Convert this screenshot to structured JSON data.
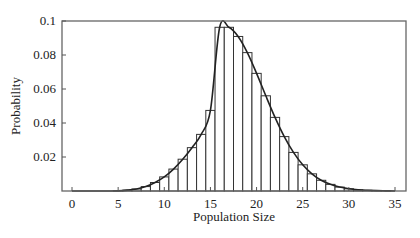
{
  "chart_data": {
    "type": "bar",
    "subtype": "histogram-with-curve",
    "title": "",
    "xlabel": "Population Size",
    "ylabel": "Probability",
    "xlim": [
      -1.2,
      36.2
    ],
    "ylim": [
      0,
      0.1
    ],
    "x_ticks": [
      0,
      5,
      10,
      15,
      20,
      25,
      30,
      35
    ],
    "y_ticks": [
      0.02,
      0.04,
      0.06,
      0.08,
      0.1
    ],
    "y_tick_labels": [
      "0.02",
      "0.04",
      "0.06",
      "0.08",
      "0.1"
    ],
    "grid": false,
    "legend": null,
    "distribution_note": "Poisson-like, mean approximately 17",
    "categories": [
      0,
      1,
      2,
      3,
      4,
      5,
      6,
      7,
      8,
      9,
      10,
      11,
      12,
      13,
      14,
      15,
      16,
      17,
      18,
      19,
      20,
      21,
      22,
      23,
      24,
      25,
      26,
      27,
      28,
      29,
      30,
      31,
      32,
      33,
      34,
      35
    ],
    "values": [
      0.0,
      0.0,
      0.0,
      0.0,
      0.0,
      0.0001,
      0.0005,
      0.0012,
      0.0026,
      0.005,
      0.0083,
      0.0129,
      0.0187,
      0.0255,
      0.0333,
      0.0474,
      0.0963,
      0.0963,
      0.0909,
      0.0814,
      0.0692,
      0.056,
      0.0433,
      0.032,
      0.0227,
      0.0154,
      0.0101,
      0.0063,
      0.0039,
      0.0023,
      0.0013,
      0.0007,
      0.0004,
      0.0002,
      0.0001,
      0.0
    ],
    "series": [
      {
        "name": "histogram",
        "kind": "bar"
      },
      {
        "name": "smooth curve",
        "kind": "line"
      }
    ]
  },
  "colors": {
    "bar_fill": "#ffffff",
    "bar_stroke": "#333333",
    "curve": "#222222",
    "axis": "#555555"
  }
}
